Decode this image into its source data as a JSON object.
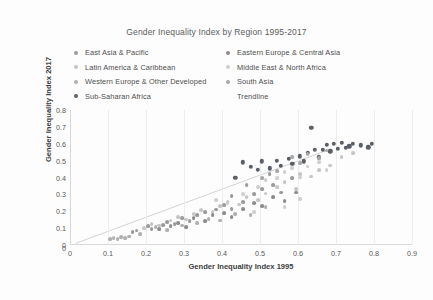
{
  "chart_data": {
    "type": "scatter",
    "title": "Gender Inequality Index by Region 1995-2017",
    "xlabel": "Gender Inequality Index 1995",
    "ylabel": "Gender Inequality Index 2017",
    "xlim": [
      0,
      0.9
    ],
    "ylim": [
      0,
      0.8
    ],
    "xticks": [
      "0",
      "0.1",
      "0.2",
      "0.3",
      "0.4",
      "0.5",
      "0.6",
      "0.7",
      "0.8",
      "0.9"
    ],
    "yticks": [
      "0",
      "0.1",
      "0.2",
      "0.3",
      "0.4",
      "0.5",
      "0.6",
      "0.7",
      "0.8"
    ],
    "grid": "vertical-only",
    "legend_position": "top",
    "series": [
      {
        "name": "East Asia & Pacific",
        "color": "#9b9b9b",
        "points": [
          [
            0.165,
            0.075
          ],
          [
            0.175,
            0.085
          ],
          [
            0.205,
            0.11
          ],
          [
            0.215,
            0.095
          ],
          [
            0.245,
            0.12
          ],
          [
            0.255,
            0.135
          ],
          [
            0.275,
            0.125
          ],
          [
            0.295,
            0.16
          ],
          [
            0.315,
            0.14
          ],
          [
            0.335,
            0.175
          ],
          [
            0.355,
            0.195
          ],
          [
            0.385,
            0.21
          ],
          [
            0.405,
            0.235
          ],
          [
            0.425,
            0.215
          ],
          [
            0.455,
            0.255
          ],
          [
            0.485,
            0.3
          ],
          [
            0.505,
            0.33
          ],
          [
            0.535,
            0.355
          ],
          [
            0.555,
            0.31
          ],
          [
            0.585,
            0.395
          ],
          [
            0.425,
            0.29
          ],
          [
            0.465,
            0.355
          ],
          [
            0.525,
            0.42
          ]
        ]
      },
      {
        "name": "Latin America & Caribbean",
        "color": "#c6c6c6",
        "points": [
          [
            0.195,
            0.1
          ],
          [
            0.215,
            0.125
          ],
          [
            0.235,
            0.115
          ],
          [
            0.265,
            0.145
          ],
          [
            0.285,
            0.165
          ],
          [
            0.305,
            0.15
          ],
          [
            0.325,
            0.185
          ],
          [
            0.345,
            0.205
          ],
          [
            0.375,
            0.195
          ],
          [
            0.395,
            0.23
          ],
          [
            0.415,
            0.255
          ],
          [
            0.445,
            0.24
          ],
          [
            0.465,
            0.285
          ],
          [
            0.495,
            0.265
          ],
          [
            0.515,
            0.305
          ],
          [
            0.545,
            0.345
          ],
          [
            0.565,
            0.375
          ],
          [
            0.595,
            0.33
          ],
          [
            0.605,
            0.42
          ],
          [
            0.635,
            0.405
          ],
          [
            0.655,
            0.445
          ],
          [
            0.685,
            0.47
          ],
          [
            0.715,
            0.52
          ],
          [
            0.745,
            0.545
          ]
        ]
      },
      {
        "name": "Western Europe & Other Developed",
        "color": "#b0b0b0",
        "points": [
          [
            0.105,
            0.035
          ],
          [
            0.115,
            0.04
          ],
          [
            0.125,
            0.035
          ],
          [
            0.135,
            0.045
          ],
          [
            0.145,
            0.04
          ],
          [
            0.155,
            0.05
          ],
          [
            0.185,
            0.065
          ],
          [
            0.225,
            0.105
          ],
          [
            0.255,
            0.09
          ],
          [
            0.295,
            0.115
          ],
          [
            0.335,
            0.13
          ],
          [
            0.365,
            0.155
          ],
          [
            0.395,
            0.145
          ],
          [
            0.435,
            0.185
          ],
          [
            0.475,
            0.175
          ],
          [
            0.515,
            0.225
          ]
        ]
      },
      {
        "name": "Sub-Saharan Africa",
        "color": "#5a5f66",
        "points": [
          [
            0.455,
            0.49
          ],
          [
            0.475,
            0.465
          ],
          [
            0.505,
            0.495
          ],
          [
            0.525,
            0.455
          ],
          [
            0.545,
            0.5
          ],
          [
            0.555,
            0.47
          ],
          [
            0.575,
            0.51
          ],
          [
            0.585,
            0.48
          ],
          [
            0.605,
            0.525
          ],
          [
            0.615,
            0.495
          ],
          [
            0.625,
            0.545
          ],
          [
            0.645,
            0.565
          ],
          [
            0.655,
            0.52
          ],
          [
            0.665,
            0.565
          ],
          [
            0.675,
            0.595
          ],
          [
            0.685,
            0.555
          ],
          [
            0.695,
            0.6
          ],
          [
            0.705,
            0.57
          ],
          [
            0.715,
            0.605
          ],
          [
            0.725,
            0.575
          ],
          [
            0.735,
            0.585
          ],
          [
            0.745,
            0.6
          ],
          [
            0.765,
            0.59
          ],
          [
            0.785,
            0.58
          ],
          [
            0.795,
            0.6
          ],
          [
            0.635,
            0.695
          ],
          [
            0.495,
            0.445
          ],
          [
            0.435,
            0.4
          ]
        ]
      },
      {
        "name": "Eastern Europe & Central Asia",
        "color": "#8d8d8d",
        "points": [
          [
            0.235,
            0.095
          ],
          [
            0.265,
            0.11
          ],
          [
            0.285,
            0.13
          ],
          [
            0.305,
            0.105
          ],
          [
            0.325,
            0.16
          ],
          [
            0.355,
            0.14
          ],
          [
            0.375,
            0.175
          ],
          [
            0.405,
            0.19
          ],
          [
            0.425,
            0.165
          ],
          [
            0.455,
            0.215
          ],
          [
            0.485,
            0.25
          ],
          [
            0.505,
            0.23
          ],
          [
            0.535,
            0.285
          ],
          [
            0.565,
            0.26
          ],
          [
            0.595,
            0.31
          ]
        ]
      },
      {
        "name": "Middle East & North Africa",
        "color": "#cfcfcf",
        "points": [
          [
            0.385,
            0.265
          ],
          [
            0.415,
            0.245
          ],
          [
            0.455,
            0.3
          ],
          [
            0.495,
            0.345
          ],
          [
            0.515,
            0.385
          ],
          [
            0.545,
            0.395
          ],
          [
            0.565,
            0.43
          ],
          [
            0.585,
            0.455
          ],
          [
            0.605,
            0.4
          ],
          [
            0.625,
            0.465
          ],
          [
            0.655,
            0.49
          ],
          [
            0.675,
            0.445
          ],
          [
            0.565,
            0.225
          ],
          [
            0.605,
            0.27
          ],
          [
            0.485,
            0.195
          ]
        ]
      },
      {
        "name": "South Asia",
        "color": "#a8a8a8",
        "points": [
          [
            0.505,
            0.395
          ],
          [
            0.545,
            0.44
          ],
          [
            0.585,
            0.52
          ],
          [
            0.605,
            0.485
          ],
          [
            0.625,
            0.54
          ],
          [
            0.655,
            0.515
          ],
          [
            0.675,
            0.56
          ]
        ]
      },
      {
        "name": "Trendline",
        "color": "#d4d4d4",
        "type": "line",
        "line": [
          [
            0.015,
            0.01
          ],
          [
            0.675,
            0.56
          ]
        ]
      }
    ]
  },
  "legend": {
    "columns": [
      [
        {
          "label": "East Asia & Pacific",
          "marker": true
        },
        {
          "label": "Latin America & Caribbean",
          "marker": true
        },
        {
          "label": "Western Europe & Other Developed",
          "marker": true
        },
        {
          "label": "Sub-Saharan Africa",
          "marker": true
        }
      ],
      [
        {
          "label": "Eastern Europe & Central Asia",
          "marker": true
        },
        {
          "label": "Middle East & North Africa",
          "marker": true
        },
        {
          "label": "South Asia",
          "marker": true
        },
        {
          "label": "Trendline",
          "marker": false
        }
      ]
    ]
  },
  "origin_label": "0"
}
